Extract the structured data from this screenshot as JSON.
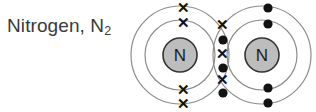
{
  "figure": {
    "label_text": "Nitrogen, N",
    "label_subscript": "2",
    "label_color": "#3a3a3a"
  },
  "diagram": {
    "type": "dot-and-cross-bonding-diagram",
    "molecule": "N2",
    "bond_type": "triple covalent bond",
    "background_color": "#ffffff",
    "shell_stroke_color": "#8c8c8c",
    "nucleus_fill_color": "#bdbdbd",
    "nucleus_stroke_color": "#333333",
    "electron_dot_color": "#121212",
    "electron_cross_color": "#121212",
    "atoms": [
      {
        "name": "left-nitrogen-atom",
        "symbol": "N",
        "cx": 180,
        "cy": 55,
        "nucleus_r": 17,
        "inner_shell_r": 35,
        "outer_shell_r": 49,
        "electron_style": "cross",
        "electron_glyph": "✕",
        "own_electrons": [
          {
            "name": "outer-shell-top-cross",
            "x": 183,
            "y": 7
          },
          {
            "name": "inner-shell-top-cross",
            "x": 183,
            "y": 22
          },
          {
            "name": "inner-shell-bottom-cross",
            "x": 183,
            "y": 89
          },
          {
            "name": "outer-shell-bottom-cross",
            "x": 183,
            "y": 103
          }
        ]
      },
      {
        "name": "right-nitrogen-atom",
        "symbol": "N",
        "cx": 262,
        "cy": 55,
        "nucleus_r": 17,
        "inner_shell_r": 35,
        "outer_shell_r": 49,
        "electron_style": "dot",
        "electron_glyph": "●",
        "own_electrons": [
          {
            "name": "outer-shell-top-dot",
            "x": 268,
            "y": 8
          },
          {
            "name": "inner-shell-top-dot",
            "x": 268,
            "y": 24
          },
          {
            "name": "inner-shell-bottom-dot",
            "x": 268,
            "y": 88
          },
          {
            "name": "outer-shell-bottom-dot",
            "x": 268,
            "y": 103
          }
        ]
      }
    ],
    "shared_electrons": [
      {
        "name": "shared-cross-1",
        "style": "cross",
        "x": 222,
        "y": 24
      },
      {
        "name": "shared-dot-1",
        "style": "dot",
        "x": 223,
        "y": 40
      },
      {
        "name": "shared-cross-2",
        "style": "cross",
        "x": 222,
        "y": 53
      },
      {
        "name": "shared-dot-2",
        "style": "dot",
        "x": 223,
        "y": 68
      },
      {
        "name": "shared-cross-3",
        "style": "cross",
        "x": 222,
        "y": 79
      },
      {
        "name": "shared-dot-3",
        "style": "dot",
        "x": 223,
        "y": 93
      }
    ],
    "electron_dot_r": 4.6
  }
}
